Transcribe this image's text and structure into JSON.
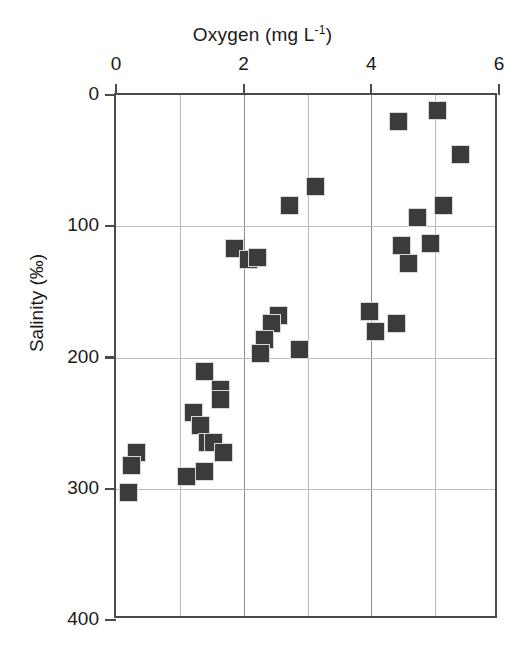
{
  "chart_data": {
    "type": "scatter",
    "title": "",
    "xlabel": "Oxygen (mg L⁻¹)",
    "xlabel_base": "Oxygen (mg L",
    "xlabel_sup": "-1",
    "xlabel_tail": ")",
    "ylabel": "Salinity (‰)",
    "x_axis_position": "top",
    "y_axis_inverted": true,
    "xlim": [
      0,
      6
    ],
    "ylim": [
      400,
      0
    ],
    "xticks": [
      0,
      2,
      4,
      6
    ],
    "xtick_labels": [
      "0",
      "2",
      "4",
      "6"
    ],
    "x_minor_gridlines": [
      1,
      3,
      5
    ],
    "yticks": [
      0,
      100,
      200,
      300,
      400
    ],
    "ytick_labels": [
      "0",
      "100",
      "200",
      "300",
      "400"
    ],
    "grid": true,
    "legend": "none",
    "marker": "square",
    "marker_color": "#3b3b3b",
    "marker_edge_color": "#d8d8d8",
    "series": [
      {
        "name": "Oxygen vs Salinity",
        "points": [
          {
            "x": 4.43,
            "y": 20
          },
          {
            "x": 5.03,
            "y": 12
          },
          {
            "x": 5.4,
            "y": 45
          },
          {
            "x": 2.72,
            "y": 84
          },
          {
            "x": 3.13,
            "y": 70
          },
          {
            "x": 5.13,
            "y": 84
          },
          {
            "x": 4.73,
            "y": 93
          },
          {
            "x": 1.85,
            "y": 117
          },
          {
            "x": 2.07,
            "y": 125
          },
          {
            "x": 2.22,
            "y": 124
          },
          {
            "x": 4.48,
            "y": 115
          },
          {
            "x": 4.92,
            "y": 113
          },
          {
            "x": 4.58,
            "y": 128
          },
          {
            "x": 2.55,
            "y": 168
          },
          {
            "x": 2.43,
            "y": 174
          },
          {
            "x": 2.33,
            "y": 186
          },
          {
            "x": 2.26,
            "y": 197
          },
          {
            "x": 2.88,
            "y": 194
          },
          {
            "x": 3.97,
            "y": 165
          },
          {
            "x": 4.06,
            "y": 180
          },
          {
            "x": 4.4,
            "y": 174
          },
          {
            "x": 1.38,
            "y": 211
          },
          {
            "x": 1.63,
            "y": 224
          },
          {
            "x": 1.63,
            "y": 232
          },
          {
            "x": 1.22,
            "y": 242
          },
          {
            "x": 1.33,
            "y": 252
          },
          {
            "x": 1.44,
            "y": 265
          },
          {
            "x": 1.52,
            "y": 265
          },
          {
            "x": 1.68,
            "y": 272
          },
          {
            "x": 0.32,
            "y": 272
          },
          {
            "x": 0.24,
            "y": 282
          },
          {
            "x": 0.2,
            "y": 303
          },
          {
            "x": 1.1,
            "y": 291
          },
          {
            "x": 1.38,
            "y": 287
          }
        ]
      }
    ]
  },
  "axes": {
    "x_title_prefix": "Oxygen (mg L",
    "x_title_sup": "-1",
    "x_title_suffix": ")",
    "y_title": "Salinity (‰)"
  }
}
